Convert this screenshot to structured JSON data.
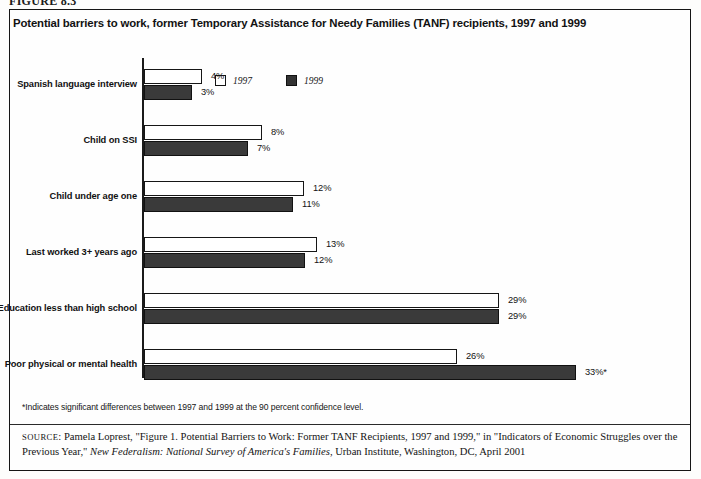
{
  "figure_label": "FIGURE 8.3",
  "title": "Potential barriers to work, former Temporary Assistance for Needy Families (TANF) recipients, 1997 and 1999",
  "legend": {
    "items": [
      {
        "label": "1997",
        "swatch": "white-square",
        "color": "#ffffff"
      },
      {
        "label": "1999",
        "swatch": "black-square",
        "color": "#3a3a3a"
      }
    ]
  },
  "footnote": "*Indicates significant differences between 1997 and 1999 at the 90 percent confidence level.",
  "source": {
    "prefix": "SOURCE",
    "part1": ": Pamela Loprest, \"Figure 1. Potential Barriers to Work: Former TANF Recipients, 1997 and 1999,\" in \"Indicators of Economic Struggles over the Previous Year,\" ",
    "italic": "New Federalism: National Survey of America's Families",
    "part2": ", Urban Institute, Washington, DC, April 2001"
  },
  "chart_data": {
    "type": "bar",
    "orientation": "horizontal",
    "title": "Potential barriers to work, former Temporary Assistance for Needy Families (TANF) recipients, 1997 and 1999",
    "xlabel": "",
    "ylabel": "",
    "grid": false,
    "legend_position": "top-center",
    "xlim": [
      0,
      35
    ],
    "categories": [
      "Spanish language interview",
      "Child on SSI",
      "Child under age one",
      "Last worked 3+ years ago",
      "Education less than high school",
      "Poor physical or mental health"
    ],
    "series": [
      {
        "name": "1997",
        "values": [
          4,
          8,
          12,
          13,
          29,
          26
        ],
        "labels": [
          "4%",
          "8%",
          "12%",
          "13%",
          "29%",
          "26%"
        ],
        "color": "#ffffff"
      },
      {
        "name": "1999",
        "values": [
          3,
          7,
          11,
          12,
          29,
          33
        ],
        "labels": [
          "3%",
          "7%",
          "11%",
          "12%",
          "29%",
          "33%*"
        ],
        "color": "#3a3a3a"
      }
    ],
    "annotations": [
      "* on 1999 value for Poor physical or mental health indicates a significant difference between 1997 and 1999 at the 90 percent confidence level."
    ]
  },
  "render": {
    "bar_px": [
      {
        "w97": 58,
        "w99": 48,
        "x97": 206,
        "x99": 196
      },
      {
        "w97": 118,
        "w99": 104,
        "x97": 266,
        "x99": 252
      },
      {
        "w97": 160,
        "w99": 149,
        "x97": 308,
        "x99": 297
      },
      {
        "w97": 173,
        "w99": 161,
        "x97": 321,
        "x99": 309
      },
      {
        "w97": 355,
        "w99": 355,
        "x97": 503,
        "x99": 503
      },
      {
        "w97": 313,
        "w99": 432,
        "x97": 461,
        "x99": 580
      }
    ]
  }
}
